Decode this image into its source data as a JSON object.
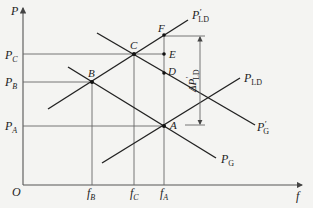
{
  "diagram": {
    "axes": {
      "y_label": "P",
      "x_label": "f",
      "origin_label": "O"
    },
    "y_ticks": [
      {
        "id": "PC",
        "main": "P",
        "sub": "C"
      },
      {
        "id": "PB",
        "main": "P",
        "sub": "B"
      },
      {
        "id": "PA",
        "main": "P",
        "sub": "A"
      }
    ],
    "x_ticks": [
      {
        "id": "fB",
        "main": "f",
        "sub": "B"
      },
      {
        "id": "fC",
        "main": "f",
        "sub": "C"
      },
      {
        "id": "fA",
        "main": "f",
        "sub": "A"
      }
    ],
    "points": {
      "A": "A",
      "B": "B",
      "C": "C",
      "D": "D",
      "E": "E",
      "F": "F"
    },
    "curves": {
      "P_LD": {
        "main": "P",
        "sub": "LD",
        "prime": ""
      },
      "P_LD_prime": {
        "main": "P",
        "sub": "LD",
        "prime": "′"
      },
      "P_G": {
        "main": "P",
        "sub": "G",
        "prime": ""
      },
      "P_G_prime": {
        "main": "P",
        "sub": "G",
        "prime": "′"
      }
    },
    "delta_label": {
      "main": "ΔP",
      "sub": "LD",
      "prime": "′"
    }
  }
}
